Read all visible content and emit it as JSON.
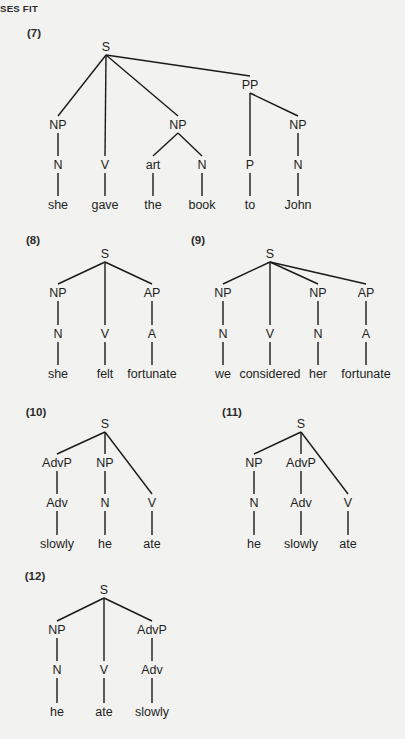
{
  "page": {
    "running_head": "SES FIT",
    "background": "#f2f2f0",
    "ink": "#1e1e1e"
  },
  "trees": [
    {
      "id": "7",
      "label": "(7)",
      "label_pos": [
        34,
        33
      ],
      "nodes": [
        {
          "t": "S",
          "x": 106,
          "y": 47,
          "p": null
        },
        {
          "t": "NP",
          "x": 58,
          "y": 125,
          "p": 0
        },
        {
          "t": "V",
          "x": 105,
          "y": 165,
          "p": 0
        },
        {
          "t": "NP",
          "x": 178,
          "y": 125,
          "p": 0
        },
        {
          "t": "PP",
          "x": 250,
          "y": 85,
          "p": 0
        },
        {
          "t": "N",
          "x": 58,
          "y": 165,
          "p": 1
        },
        {
          "t": "art",
          "x": 153,
          "y": 165,
          "p": 3
        },
        {
          "t": "N",
          "x": 202,
          "y": 165,
          "p": 3
        },
        {
          "t": "P",
          "x": 250,
          "y": 165,
          "p": 4
        },
        {
          "t": "NP",
          "x": 298,
          "y": 125,
          "p": 4
        },
        {
          "t": "N",
          "x": 298,
          "y": 165,
          "p": 9
        },
        {
          "t": "she",
          "x": 58,
          "y": 205,
          "p": 5
        },
        {
          "t": "gave",
          "x": 105,
          "y": 205,
          "p": 2
        },
        {
          "t": "the",
          "x": 153,
          "y": 205,
          "p": 6
        },
        {
          "t": "book",
          "x": 202,
          "y": 205,
          "p": 7
        },
        {
          "t": "to",
          "x": 250,
          "y": 205,
          "p": 8
        },
        {
          "t": "John",
          "x": 298,
          "y": 205,
          "p": 10
        }
      ],
      "sentence": "she gave the book to John"
    },
    {
      "id": "8",
      "label": "(8)",
      "label_pos": [
        33,
        240
      ],
      "nodes": [
        {
          "t": "S",
          "x": 105,
          "y": 254,
          "p": null
        },
        {
          "t": "NP",
          "x": 58,
          "y": 293,
          "p": 0
        },
        {
          "t": "V",
          "x": 105,
          "y": 334,
          "p": 0
        },
        {
          "t": "AP",
          "x": 152,
          "y": 293,
          "p": 0
        },
        {
          "t": "N",
          "x": 58,
          "y": 334,
          "p": 1
        },
        {
          "t": "A",
          "x": 152,
          "y": 334,
          "p": 3
        },
        {
          "t": "she",
          "x": 58,
          "y": 374,
          "p": 4
        },
        {
          "t": "felt",
          "x": 105,
          "y": 374,
          "p": 2
        },
        {
          "t": "fortunate",
          "x": 152,
          "y": 374,
          "p": 5
        }
      ],
      "sentence": "she felt fortunate"
    },
    {
      "id": "9",
      "label": "(9)",
      "label_pos": [
        198,
        240
      ],
      "nodes": [
        {
          "t": "S",
          "x": 270,
          "y": 254,
          "p": null
        },
        {
          "t": "NP",
          "x": 223,
          "y": 293,
          "p": 0
        },
        {
          "t": "V",
          "x": 270,
          "y": 334,
          "p": 0
        },
        {
          "t": "NP",
          "x": 318,
          "y": 293,
          "p": 0
        },
        {
          "t": "AP",
          "x": 366,
          "y": 293,
          "p": 0
        },
        {
          "t": "N",
          "x": 223,
          "y": 334,
          "p": 1
        },
        {
          "t": "N",
          "x": 318,
          "y": 334,
          "p": 3
        },
        {
          "t": "A",
          "x": 366,
          "y": 334,
          "p": 4
        },
        {
          "t": "we",
          "x": 223,
          "y": 374,
          "p": 5
        },
        {
          "t": "considered",
          "x": 270,
          "y": 374,
          "p": 2
        },
        {
          "t": "her",
          "x": 318,
          "y": 374,
          "p": 6
        },
        {
          "t": "fortunate",
          "x": 366,
          "y": 374,
          "p": 7
        }
      ],
      "sentence": "we considered her fortunate"
    },
    {
      "id": "10",
      "label": "(10)",
      "label_pos": [
        36,
        412
      ],
      "nodes": [
        {
          "t": "S",
          "x": 105,
          "y": 424,
          "p": null
        },
        {
          "t": "AdvP",
          "x": 57,
          "y": 463,
          "p": 0
        },
        {
          "t": "NP",
          "x": 105,
          "y": 463,
          "p": 0
        },
        {
          "t": "V",
          "x": 152,
          "y": 503,
          "p": 0
        },
        {
          "t": "Adv",
          "x": 57,
          "y": 503,
          "p": 1
        },
        {
          "t": "N",
          "x": 105,
          "y": 503,
          "p": 2
        },
        {
          "t": "slowly",
          "x": 57,
          "y": 544,
          "p": 4
        },
        {
          "t": "he",
          "x": 105,
          "y": 544,
          "p": 5
        },
        {
          "t": "ate",
          "x": 152,
          "y": 544,
          "p": 3
        }
      ],
      "sentence": "slowly he ate"
    },
    {
      "id": "11",
      "label": "(11)",
      "label_pos": [
        232,
        412
      ],
      "nodes": [
        {
          "t": "S",
          "x": 301,
          "y": 424,
          "p": null
        },
        {
          "t": "NP",
          "x": 254,
          "y": 463,
          "p": 0
        },
        {
          "t": "AdvP",
          "x": 301,
          "y": 463,
          "p": 0
        },
        {
          "t": "V",
          "x": 348,
          "y": 503,
          "p": 0
        },
        {
          "t": "N",
          "x": 254,
          "y": 503,
          "p": 1
        },
        {
          "t": "Adv",
          "x": 301,
          "y": 503,
          "p": 2
        },
        {
          "t": "he",
          "x": 254,
          "y": 544,
          "p": 4
        },
        {
          "t": "slowly",
          "x": 301,
          "y": 544,
          "p": 5
        },
        {
          "t": "ate",
          "x": 348,
          "y": 544,
          "p": 3
        }
      ],
      "sentence": "he slowly ate"
    },
    {
      "id": "12",
      "label": "(12)",
      "label_pos": [
        35,
        576
      ],
      "nodes": [
        {
          "t": "S",
          "x": 104,
          "y": 590,
          "p": null
        },
        {
          "t": "NP",
          "x": 57,
          "y": 630,
          "p": 0
        },
        {
          "t": "V",
          "x": 104,
          "y": 670,
          "p": 0
        },
        {
          "t": "AdvP",
          "x": 152,
          "y": 630,
          "p": 0
        },
        {
          "t": "N",
          "x": 57,
          "y": 670,
          "p": 1
        },
        {
          "t": "Adv",
          "x": 152,
          "y": 670,
          "p": 3
        },
        {
          "t": "he",
          "x": 57,
          "y": 712,
          "p": 4
        },
        {
          "t": "ate",
          "x": 104,
          "y": 712,
          "p": 2
        },
        {
          "t": "slowly",
          "x": 152,
          "y": 712,
          "p": 5
        }
      ],
      "sentence": "he ate slowly"
    }
  ]
}
